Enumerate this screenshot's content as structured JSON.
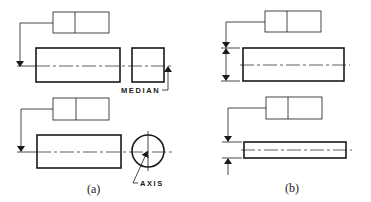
{
  "figure": {
    "panel_a": {
      "caption": "(a)",
      "labels": {
        "median": "MEDIAN",
        "axis": "AXIS"
      }
    },
    "panel_b": {
      "caption": "(b)"
    }
  },
  "colors": {
    "line": "#1a1a1a",
    "background": "#ffffff"
  }
}
